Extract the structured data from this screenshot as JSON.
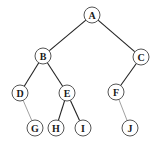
{
  "diagram": {
    "type": "binary-tree",
    "nodes": [
      {
        "id": "A",
        "label": "A",
        "x": 92,
        "y": 15
      },
      {
        "id": "B",
        "label": "B",
        "x": 43,
        "y": 56
      },
      {
        "id": "C",
        "label": "C",
        "x": 141,
        "y": 57
      },
      {
        "id": "D",
        "label": "D",
        "x": 20,
        "y": 93
      },
      {
        "id": "E",
        "label": "E",
        "x": 67,
        "y": 93
      },
      {
        "id": "F",
        "label": "F",
        "x": 116,
        "y": 92
      },
      {
        "id": "G",
        "label": "G",
        "x": 35,
        "y": 128
      },
      {
        "id": "H",
        "label": "H",
        "x": 56,
        "y": 128
      },
      {
        "id": "I",
        "label": "I",
        "x": 83,
        "y": 128
      },
      {
        "id": "J",
        "label": "J",
        "x": 130,
        "y": 128
      }
    ],
    "edges": [
      {
        "from": "A",
        "to": "B",
        "style": "dark"
      },
      {
        "from": "A",
        "to": "C",
        "style": "dark"
      },
      {
        "from": "B",
        "to": "D",
        "style": "dark"
      },
      {
        "from": "B",
        "to": "E",
        "style": "dark"
      },
      {
        "from": "C",
        "to": "F",
        "style": "dark"
      },
      {
        "from": "D",
        "to": "G",
        "style": "light"
      },
      {
        "from": "E",
        "to": "H",
        "style": "dark"
      },
      {
        "from": "E",
        "to": "I",
        "style": "dark"
      },
      {
        "from": "F",
        "to": "J",
        "style": "light"
      }
    ],
    "node_radius": 8
  }
}
